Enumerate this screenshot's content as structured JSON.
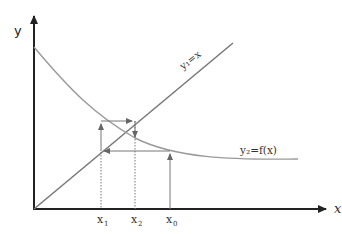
{
  "diagram": {
    "type": "fixed-point-iteration",
    "axes": {
      "x_label": "x",
      "y_label": "y"
    },
    "lines": {
      "identity_label": "y₁=x",
      "function_label": "y₂=f(x)"
    },
    "points": [
      {
        "label": "x₁",
        "sub": "1"
      },
      {
        "label": "x₂",
        "sub": "2"
      },
      {
        "label": "x₀",
        "sub": "0"
      }
    ],
    "colors": {
      "axis": "#222222",
      "curve": "#9a9a9a",
      "identity_line": "#7a7a7a",
      "guides": "#777777"
    }
  }
}
